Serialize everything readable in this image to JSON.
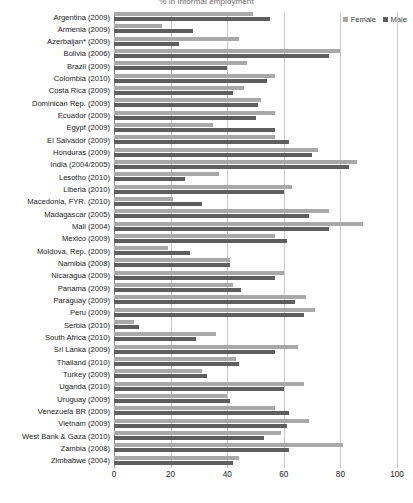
{
  "chart_data": {
    "type": "bar",
    "orientation": "horizontal",
    "title": "% in informal employment",
    "xlabel": "",
    "ylabel": "",
    "xlim": [
      0,
      100
    ],
    "xticks": [
      0,
      20,
      40,
      60,
      80,
      100
    ],
    "grid": true,
    "legend_position": "top-right",
    "legend": [
      "Female",
      "Male"
    ],
    "colors": {
      "female": "#a8a8a8",
      "male": "#5e5e5e",
      "gridline": "#c9c9c9",
      "axis": "#8a8a8a"
    },
    "categories": [
      "Argentina (2009)",
      "Armenia (2009)",
      "Azerbaijan* (2009)",
      "Bolivia (2006)",
      "Brazil (2009)",
      "Colombia (2010)",
      "Costa Rica (2009)",
      "Dominican Rep. (2009)",
      "Ecuador (2009)",
      "Egypt (2009)",
      "El Salvador (2009)",
      "Honduras (2009)",
      "India (2004/2005)",
      "Lesotho (2010)",
      "Liberia (2010)",
      "Macedonia, FYR. (2010)",
      "Madagascar (2005)",
      "Mali (2004)",
      "Mexico (2009)",
      "Moldova, Rep. (2009)",
      "Namibia (2008)",
      "Nicaragua (2009)",
      "Panama (2009)",
      "Paraguay (2009)",
      "Peru (2009)",
      "Serbia (2010)",
      "South Africa (2010)",
      "Sri Lanka (2009)",
      "Thailand (2010)",
      "Turkey (2009)",
      "Uganda (2010)",
      "Uruguay (2009)",
      "Venezuela BR (2009)",
      "Vietnam (2009)",
      "West Bank & Gaza (2010)",
      "Zambia (2008)",
      "Zimbabwe (2004)"
    ],
    "series": [
      {
        "name": "Female",
        "color": "#a8a8a8",
        "values": [
          49,
          17,
          44,
          80,
          47,
          57,
          46,
          52,
          57,
          35,
          57,
          72,
          86,
          37,
          63,
          21,
          76,
          88,
          57,
          19,
          41,
          60,
          42,
          68,
          71,
          7,
          36,
          65,
          43,
          31,
          67,
          40,
          57,
          69,
          59,
          81,
          44
        ]
      },
      {
        "name": "Male",
        "color": "#5e5e5e",
        "values": [
          55,
          28,
          23,
          76,
          40,
          54,
          42,
          51,
          50,
          57,
          62,
          70,
          83,
          25,
          60,
          31,
          69,
          76,
          61,
          27,
          41,
          57,
          45,
          64,
          67,
          9,
          29,
          57,
          44,
          33,
          60,
          41,
          62,
          61,
          53,
          62,
          42
        ]
      }
    ]
  }
}
